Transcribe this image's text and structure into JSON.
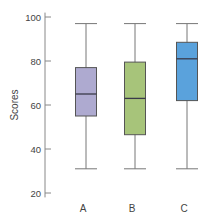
{
  "chart_data": {
    "type": "boxplot",
    "title": "",
    "xlabel": "",
    "ylabel": "Scores",
    "ylim": [
      18,
      102
    ],
    "yticks": [
      20,
      40,
      60,
      80,
      100
    ],
    "grid": false,
    "legend": null,
    "categories": [
      "A",
      "B",
      "C"
    ],
    "series": [
      {
        "name": "A",
        "whisker_low": 31,
        "q1": 55,
        "median": 65,
        "q3": 77,
        "whisker_high": 97,
        "color": "#aeaad0"
      },
      {
        "name": "B",
        "whisker_low": 31,
        "q1": 46.5,
        "median": 63,
        "q3": 79.5,
        "whisker_high": 97,
        "color": "#a7c47a"
      },
      {
        "name": "C",
        "whisker_low": 31,
        "q1": 62,
        "median": 81,
        "q3": 88.5,
        "whisker_high": 97,
        "color": "#5aa2dc"
      }
    ]
  }
}
